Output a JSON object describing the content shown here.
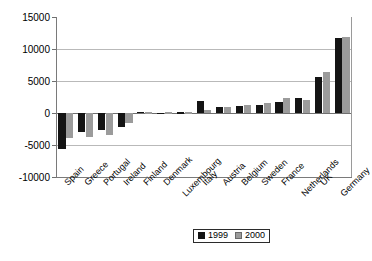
{
  "chart_data": {
    "type": "bar",
    "title": "",
    "subtitle": "",
    "xlabel": "",
    "ylabel": "",
    "ylim": [
      -10000,
      15000
    ],
    "yticks": [
      "15000",
      "10000",
      "5000",
      "0",
      "-5000",
      "-10000"
    ],
    "ytick_values": [
      15000,
      10000,
      5000,
      0,
      -5000,
      -10000
    ],
    "grid": true,
    "legend_position": "bottom-center",
    "categories": [
      "Spain",
      "Greece",
      "Portugal",
      "Ireland",
      "Finland",
      "Denmark",
      "Luxembourg",
      "Italy",
      "Austria",
      "Belgium",
      "Sweden",
      "France",
      "Netherlands",
      "UK",
      "Germany"
    ],
    "series": [
      {
        "name": "1999",
        "color": "#141414",
        "values": [
          -5600,
          -3000,
          -2700,
          -2200,
          200,
          0,
          100,
          1900,
          900,
          1100,
          1300,
          1700,
          2400,
          5600,
          11700
        ]
      },
      {
        "name": "2000",
        "color": "#9b9b9b",
        "values": [
          -3850,
          -3800,
          -3400,
          -1500,
          100,
          100,
          100,
          400,
          900,
          1300,
          1500,
          2300,
          2100,
          6400,
          11800
        ]
      }
    ]
  },
  "legend": {
    "entries": [
      {
        "label": "1999",
        "swatch": "black-square-icon"
      },
      {
        "label": "2000",
        "swatch": "gray-square-icon"
      }
    ]
  }
}
